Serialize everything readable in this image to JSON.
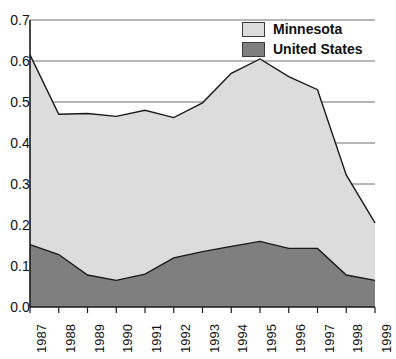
{
  "chart_data": {
    "type": "area",
    "stacked": false,
    "title": "",
    "xlabel": "",
    "ylabel": "",
    "categories": [
      "1987",
      "1988",
      "1989",
      "1990",
      "1991",
      "1992",
      "1993",
      "1994",
      "1995",
      "1996",
      "1997",
      "1998",
      "1999"
    ],
    "x": [
      1987,
      1988,
      1989,
      1990,
      1991,
      1992,
      1993,
      1994,
      1995,
      1996,
      1997,
      1998,
      1999
    ],
    "series": [
      {
        "name": "Minnesota",
        "color": "#dcdcdc",
        "values": [
          0.615,
          0.47,
          0.472,
          0.465,
          0.48,
          0.462,
          0.498,
          0.57,
          0.605,
          0.562,
          0.53,
          0.322,
          0.205
        ]
      },
      {
        "name": "United States",
        "color": "#7f7f7f",
        "values": [
          0.152,
          0.128,
          0.078,
          0.065,
          0.08,
          0.12,
          0.135,
          0.148,
          0.16,
          0.143,
          0.143,
          0.078,
          0.065
        ]
      }
    ],
    "ylim": [
      0.0,
      0.7
    ],
    "ytick_values": [
      0.0,
      0.1,
      0.2,
      0.3,
      0.4,
      0.5,
      0.6,
      0.7
    ],
    "ytick_labels": [
      "0.0",
      "0.1",
      "0.2",
      "0.3",
      "0.4",
      "0.5",
      "0.6",
      "0.7"
    ],
    "grid": true,
    "gridlines_at": [
      0.3,
      0.4,
      0.5,
      0.6,
      0.7
    ],
    "legend_position": "top-right",
    "annotations": []
  },
  "legend": {
    "entries": [
      {
        "label": "Minnesota",
        "color": "#dcdcdc"
      },
      {
        "label": "United States",
        "color": "#7f7f7f"
      }
    ]
  },
  "axis": {
    "y_labels": [
      "0.7",
      "0.6",
      "0.5",
      "0.4",
      "0.3",
      "0.2",
      "0.1",
      "0.0"
    ],
    "x_labels": [
      "1987",
      "1988",
      "1989",
      "1990",
      "1991",
      "1992",
      "1993",
      "1994",
      "1995",
      "1996",
      "1997",
      "1998",
      "1999"
    ]
  },
  "colors": {
    "minnesota": "#dcdcdc",
    "united_states": "#7f7f7f",
    "axis": "#1a1a1a",
    "grid": "#6e6e6e",
    "background": "#ffffff"
  }
}
